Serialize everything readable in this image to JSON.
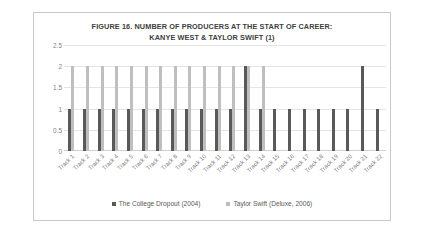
{
  "figure": {
    "title_line1": "FIGURE 16. NUMBER OF PRODUCERS AT THE START OF CAREER:",
    "title_line2": "KANYE WEST & TAYLOR SWIFT (1)"
  },
  "colors": {
    "series_a": "#595959",
    "series_b": "#bfbfbf",
    "gridline": "#e4e4e4",
    "axis_text": "#7f7f7f",
    "title_text": "#404040",
    "frame": "#c8c8c8",
    "background": "#ffffff"
  },
  "chart_data": {
    "type": "bar",
    "title": "FIGURE 16. NUMBER OF PRODUCERS AT THE START OF CAREER: KANYE WEST & TAYLOR SWIFT (1)",
    "xlabel": "",
    "ylabel": "",
    "ylim": [
      0,
      2.5
    ],
    "yticks": [
      "0",
      "0.5",
      "1",
      "1.5",
      "2",
      "2.5"
    ],
    "ytick_values": [
      0,
      0.5,
      1,
      1.5,
      2,
      2.5
    ],
    "grid": true,
    "legend_position": "bottom",
    "categories": [
      "Track 1",
      "Track 2",
      "Track 3",
      "Track 4",
      "Track 5",
      "Track 6",
      "Track 7",
      "Track 8",
      "Track 9",
      "Track 10",
      "Track 11",
      "Track 12",
      "Track 13",
      "Track 14",
      "Track 15",
      "Track 16",
      "Track 17",
      "Track 18",
      "Track 19",
      "Track 20",
      "Track 21",
      "Track 22"
    ],
    "series": [
      {
        "name": "The College Dropout (2004)",
        "color": "#595959",
        "values": [
          1,
          1,
          1,
          1,
          1,
          1,
          1,
          1,
          1,
          1,
          1,
          1,
          2,
          1,
          1,
          1,
          1,
          1,
          1,
          1,
          2,
          1
        ]
      },
      {
        "name": "Taylor Swift (Deluxe, 2006)",
        "color": "#bfbfbf",
        "values": [
          2,
          2,
          2,
          2,
          2,
          2,
          2,
          2,
          2,
          2,
          2,
          2,
          2,
          2,
          null,
          null,
          null,
          null,
          null,
          null,
          null,
          null
        ]
      }
    ]
  },
  "legend": {
    "items": [
      {
        "label": "The College Dropout (2004)",
        "color": "#595959"
      },
      {
        "label": "Taylor Swift (Deluxe, 2006)",
        "color": "#bfbfbf"
      }
    ]
  }
}
